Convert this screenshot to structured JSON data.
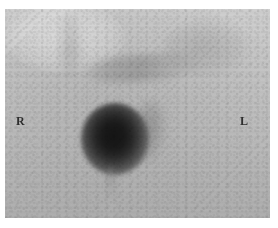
{
  "figure": {
    "kind": "nuclear-medicine-scintigraphy-image",
    "modality_label": "",
    "caption": "",
    "orientation_markers": {
      "right_label": "R",
      "left_label": "L"
    },
    "colors": {
      "background_plate_light": "#cfcfcf",
      "background_plate_dark": "#aeaeae",
      "focal_uptake_core": "#141414",
      "marker_text": "#2e2e2e",
      "page_mat": "#ffffff"
    },
    "regions": [
      {
        "name": "focal-uptake",
        "description": "intense rounded focus of tracer accumulation, left-of-centre",
        "intensity": "very high"
      },
      {
        "name": "para-focal-shadow",
        "description": "faint elongated activity lateral and inferior to the focus",
        "intensity": "low"
      },
      {
        "name": "upper-band-structure",
        "description": "faint transverse band of activity across the upper mid field",
        "intensity": "low"
      },
      {
        "name": "midline-upper-structure",
        "description": "faint vertical midline structure superiorly",
        "intensity": "low"
      },
      {
        "name": "upper-right-structure",
        "description": "diffuse haze in the upper right field",
        "intensity": "very low"
      },
      {
        "name": "descending-streak",
        "description": "faint vertical streak descending inferiorly from the focus",
        "intensity": "very low"
      }
    ]
  }
}
